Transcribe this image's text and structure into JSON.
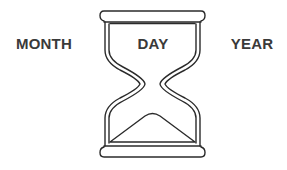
{
  "labels": {
    "left": "MONTH",
    "center": "DAY",
    "right": "YEAR"
  },
  "icon": "hourglass-icon",
  "colors": {
    "background": "#ffffff",
    "text": "#3a3a3a",
    "stroke": "#2b2b2b"
  }
}
